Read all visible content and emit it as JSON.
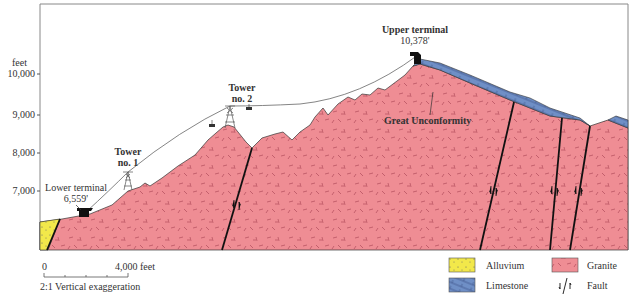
{
  "diagram": {
    "type": "geologic-cross-section",
    "y_axis": {
      "unit_label": "feet",
      "ticks": [
        {
          "label": "10,000",
          "y": 74
        },
        {
          "label": "9,000",
          "y": 115
        },
        {
          "label": "8,000",
          "y": 153
        },
        {
          "label": "7,000",
          "y": 191
        }
      ]
    },
    "labels": {
      "upper_terminal": "Upper terminal",
      "upper_elev": "10,378'",
      "lower_terminal": "Lower terminal",
      "lower_elev": "6,559'",
      "tower2_a": "Tower",
      "tower2_b": "no. 2",
      "tower1_a": "Tower",
      "tower1_b": "no. 1",
      "unconformity": "Great Unconformity"
    },
    "scale": {
      "start": "0",
      "end": "4,000 feet",
      "note": "2:1 Vertical exaggeration"
    },
    "legend": [
      {
        "label": "Alluvium",
        "color": "#f2e84a"
      },
      {
        "label": "Granite",
        "color": "#ef8d94"
      },
      {
        "label": "Limestone",
        "color": "#6f8fc6"
      },
      {
        "label": "Fault",
        "color": "#111111"
      }
    ],
    "colors": {
      "granite": "#ef8d94",
      "granite_dash": "#b04a5a",
      "limestone": "#6f8fc6",
      "alluvium": "#f2e84a",
      "cable": "#666666"
    }
  }
}
